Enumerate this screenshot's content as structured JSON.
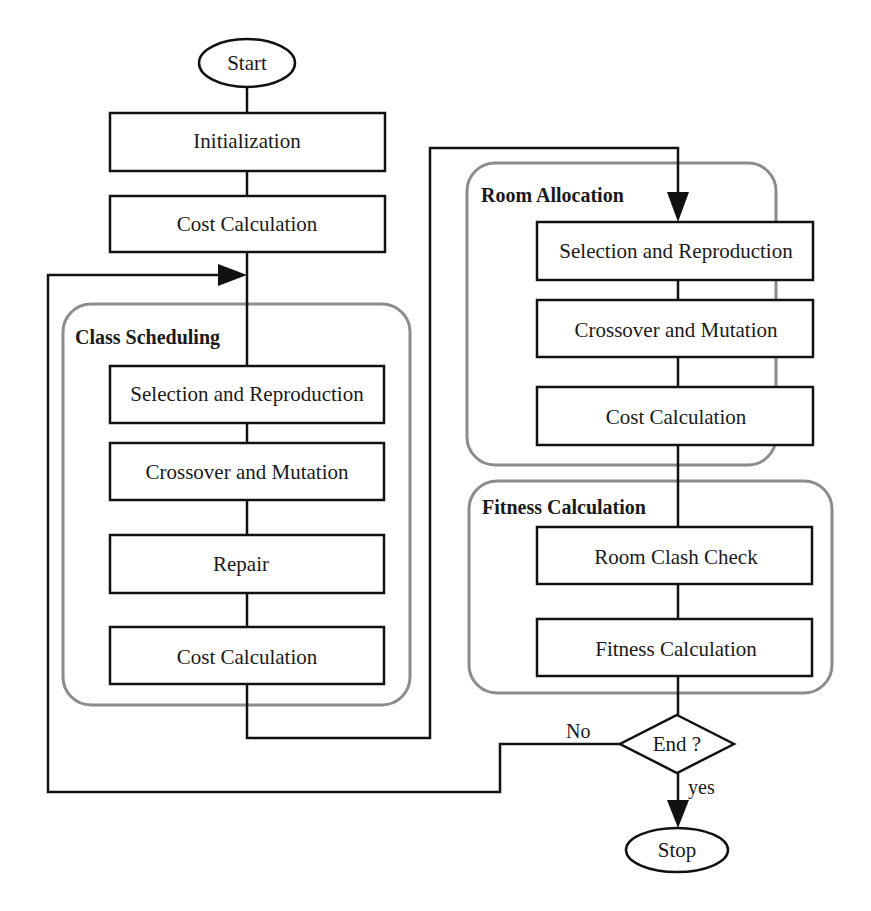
{
  "diagram": {
    "type": "flowchart",
    "colors": {
      "line": "#111111",
      "group_border": "#8c8c8c",
      "text": "#1a1a1a",
      "background": "#ffffff"
    },
    "terminals": {
      "start": "Start",
      "stop": "Stop"
    },
    "top_steps": {
      "initialization": "Initialization",
      "cost_calculation": "Cost Calculation"
    },
    "groups": {
      "class_scheduling": {
        "title": "Class Scheduling",
        "steps": [
          "Selection and Reproduction",
          "Crossover and Mutation",
          "Repair",
          "Cost Calculation"
        ]
      },
      "room_allocation": {
        "title": "Room Allocation",
        "steps": [
          "Selection and Reproduction",
          "Crossover and Mutation",
          "Cost Calculation"
        ]
      },
      "fitness_calculation": {
        "title": "Fitness Calculation",
        "steps": [
          "Room Clash Check",
          "Fitness Calculation"
        ]
      }
    },
    "decision": {
      "label": "End ?",
      "no_label": "No",
      "yes_label": "yes"
    }
  }
}
